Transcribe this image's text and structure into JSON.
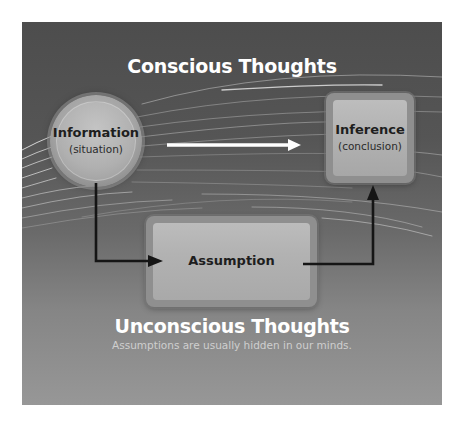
{
  "diagram": {
    "colors": {
      "panel_top": "#4d4d4d",
      "panel_bottom": "#979797",
      "title_text": "#ffffff",
      "subtitle_text": "#cfcfcf",
      "node_fill": "#b5b5b5",
      "arrow_black": "#151515",
      "arrow_white": "#ffffff"
    },
    "top_heading": "Conscious Thoughts",
    "bottom_heading": "Unconscious Thoughts",
    "bottom_caption": "Assumptions are usually hidden in our minds.",
    "nodes": {
      "information": {
        "title": "Information",
        "subtitle": "(situation)",
        "shape": "circle"
      },
      "inference": {
        "title": "Inference",
        "subtitle": "(conclusion)",
        "shape": "rounded-square"
      },
      "assumption": {
        "title": "Assumption",
        "shape": "rounded-rectangle"
      }
    },
    "edges": [
      {
        "from": "information",
        "to": "inference",
        "style": "white-arrow"
      },
      {
        "from": "information",
        "to": "assumption",
        "style": "black-elbow-arrow"
      },
      {
        "from": "assumption",
        "to": "inference",
        "style": "black-elbow-arrow"
      }
    ]
  }
}
